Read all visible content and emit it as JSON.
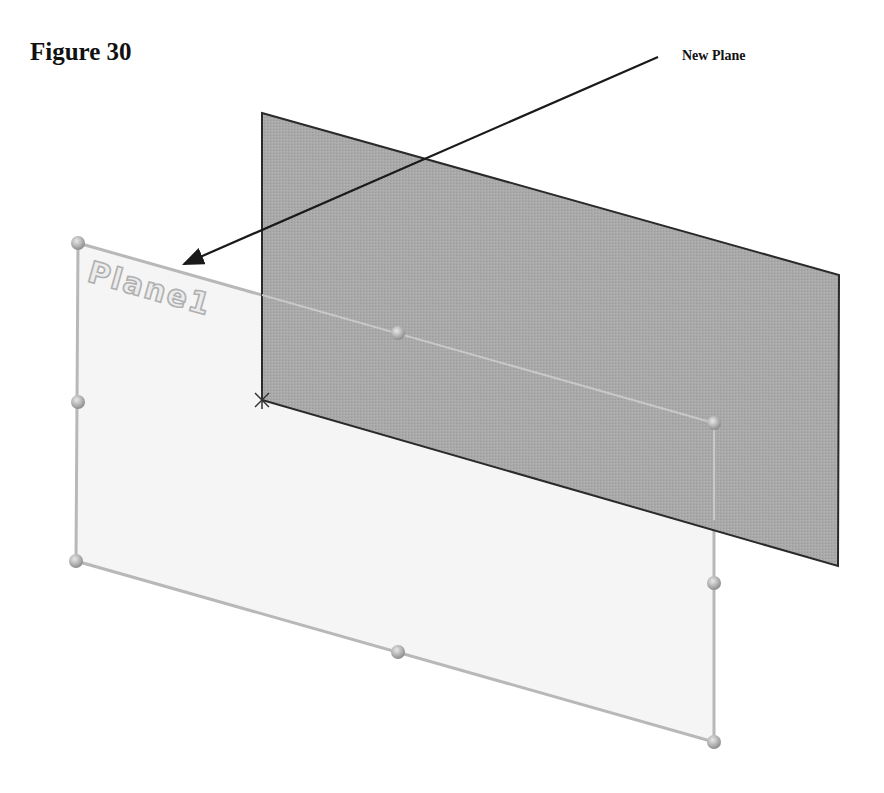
{
  "figure": {
    "title": "Figure 30",
    "callout_label": "New Plane",
    "plane_label": "Plane1"
  },
  "colors": {
    "existing_plane_fill": "#a8a8a8",
    "existing_plane_edge": "#2a2a2a",
    "new_plane_fill": "#f4f4f4",
    "new_plane_edge": "#b5b5b5",
    "handle": "#b0b0b0",
    "arrow": "#1a1a1a",
    "label": "#b8b8b8"
  },
  "geometry": {
    "existing_plane": [
      [
        262,
        113
      ],
      [
        839,
        275
      ],
      [
        838,
        566
      ],
      [
        262,
        400
      ]
    ],
    "new_plane": [
      [
        78,
        243
      ],
      [
        714,
        423
      ],
      [
        714,
        742
      ],
      [
        76,
        561
      ]
    ],
    "handles": [
      [
        78,
        243
      ],
      [
        398,
        333
      ],
      [
        714,
        423
      ],
      [
        78,
        402
      ],
      [
        714,
        583
      ],
      [
        76,
        561
      ],
      [
        398,
        652
      ],
      [
        714,
        742
      ]
    ],
    "arrow": {
      "from": [
        658,
        57
      ],
      "to": [
        180,
        266
      ]
    },
    "origin": [
      262,
      400
    ]
  }
}
